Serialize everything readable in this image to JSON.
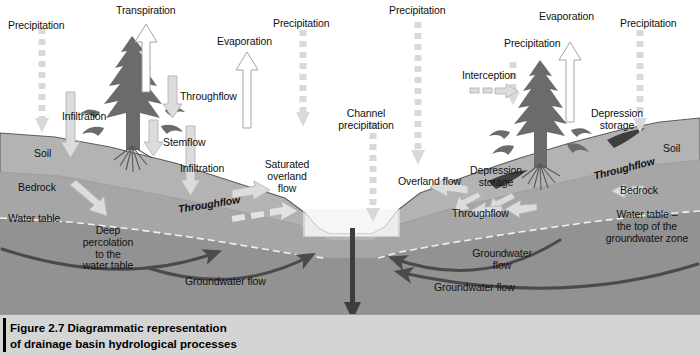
{
  "figure": {
    "caption_line1": "Figure 2.7  Diagrammatic representation",
    "caption_line2": "of drainage basin hydrological processes",
    "background": "#ffffff"
  },
  "colors": {
    "soil": "#b0b0b0",
    "bedrock": "#a3a3a3",
    "groundwater": "#8f8f8f",
    "water": "#e6e6e6",
    "tree": "#6e6e6e",
    "arrow_light": "#d9d9d9",
    "arrow_dark": "#4a4a4a",
    "caption_bg": "#d4d4d4",
    "text": "#111111"
  },
  "labels": {
    "precipitation_left": "Precipitation",
    "transpiration": "Transpiration",
    "evaporation_left": "Evaporation",
    "precipitation_mid": "Precipitation",
    "precipitation_midright": "Precipitation",
    "evaporation_right": "Evaporation",
    "precipitation_tree_right": "Precipitation",
    "precipitation_right": "Precipitation",
    "interception": "Interception",
    "infiltration_1": "Infiltration",
    "throughflow_tree": "Throughflow",
    "stemflow": "Stemflow",
    "infiltration_2": "Infiltration",
    "soil_left": "Soil",
    "bedrock_left": "Bedrock",
    "water_table_left": "Water table",
    "deep_percolation": "Deep\npercolation\nto the\nwater table",
    "throughflow_left_italic": "Throughflow",
    "saturated_overland_flow": "Saturated\noverland\nflow",
    "channel_precipitation": "Channel\nprecipitation",
    "overland_flow": "Overland flow",
    "depression_storage_left": "Depression\nstorage",
    "depression_storage_right": "Depression\nstorage",
    "throughflow_right_low": "Throughflow",
    "throughflow_right_italic": "Throughflow",
    "soil_right": "Soil",
    "bedrock_right": "Bedrock",
    "water_table_right": "Water table –\nthe top of the\ngroundwater zone",
    "groundwater_flow_left": "Groundwater flow",
    "groundwater_flow_mid": "Groundwater\nflow",
    "groundwater_flow_right": "Groundwater flow",
    "runoff": "Runoff\n(streamflow)"
  }
}
